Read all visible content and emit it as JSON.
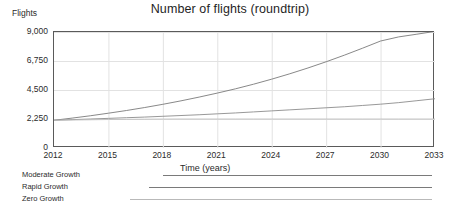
{
  "chart_data": {
    "type": "line",
    "title": "Number of flights (roundtrip)",
    "xlabel": "Time (years)",
    "ylabel": "Flights",
    "xlim": [
      2012,
      2033
    ],
    "ylim": [
      0,
      9000
    ],
    "grid": true,
    "legend_position": "below",
    "x_ticks": [
      "2012",
      "2015",
      "2018",
      "2021",
      "2024",
      "2027",
      "2030",
      "2033"
    ],
    "x_tick_values": [
      2012,
      2015,
      2018,
      2021,
      2024,
      2027,
      2030,
      2033
    ],
    "y_ticks": [
      "0",
      "2,250",
      "4,500",
      "6,750",
      "9,000"
    ],
    "y_tick_values": [
      0,
      2250,
      4500,
      6750,
      9000
    ],
    "x": [
      2012,
      2013,
      2014,
      2015,
      2016,
      2017,
      2018,
      2019,
      2020,
      2021,
      2022,
      2023,
      2024,
      2025,
      2026,
      2027,
      2028,
      2029,
      2030,
      2031,
      2032,
      2033
    ],
    "series": [
      {
        "name": "Rapid Growth",
        "color": "#7a7a7a",
        "values": [
          2150,
          2320,
          2500,
          2700,
          2910,
          3140,
          3390,
          3660,
          3950,
          4260,
          4590,
          4950,
          5340,
          5760,
          6210,
          6690,
          7200,
          7740,
          8300,
          8620,
          8830,
          9050
        ]
      },
      {
        "name": "Moderate Growth",
        "color": "#8c8c8c",
        "values": [
          2150,
          2200,
          2250,
          2300,
          2350,
          2400,
          2460,
          2520,
          2580,
          2650,
          2720,
          2800,
          2880,
          2960,
          3040,
          3120,
          3200,
          3300,
          3400,
          3520,
          3670,
          3820
        ]
      },
      {
        "name": "Zero Growth",
        "color": "#bfbfbf",
        "values": [
          2150,
          2170,
          2190,
          2210,
          2225,
          2235,
          2245,
          2250,
          2250,
          2250,
          2250,
          2250,
          2250,
          2250,
          2250,
          2250,
          2250,
          2250,
          2250,
          2250,
          2250,
          2250
        ]
      }
    ]
  },
  "legend": {
    "entries": [
      {
        "label": "Moderate Growth"
      },
      {
        "label": "Rapid Growth"
      },
      {
        "label": "Zero Growth"
      }
    ]
  }
}
